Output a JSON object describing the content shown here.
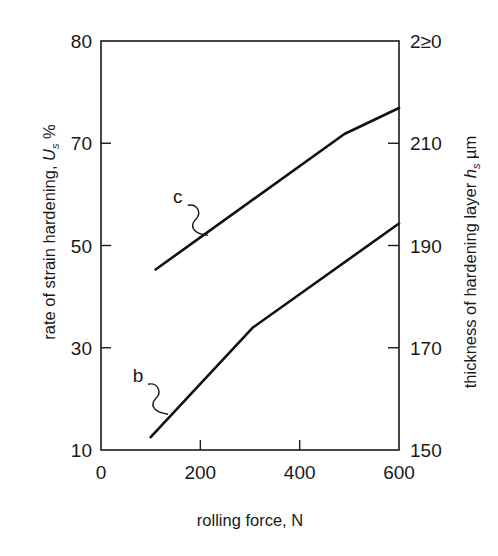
{
  "chart_data": {
    "type": "line",
    "title": "",
    "xlabel": "rolling force, N",
    "ylabel": {
      "text": "rate of strain hardening, ",
      "symbol": "U",
      "subscript": "s",
      "unit": " %"
    },
    "ylabel_right": {
      "text": "thickness of hardening layer ",
      "symbol": "h",
      "subscript": "s",
      "unit": " µm"
    },
    "xlim": [
      0,
      600
    ],
    "ylim": [
      10,
      90
    ],
    "ylim_right": [
      150,
      230
    ],
    "x_ticks": [
      {
        "value": 0,
        "label": "0"
      },
      {
        "value": 200,
        "label": "200"
      },
      {
        "value": 400,
        "label": "400"
      },
      {
        "value": 600,
        "label": "600"
      }
    ],
    "y_ticks": [
      {
        "value": 10,
        "label": "10"
      },
      {
        "value": 30,
        "label": "30"
      },
      {
        "value": 50,
        "label": "50"
      },
      {
        "value": 70,
        "label": "70"
      },
      {
        "value": 90,
        "label": "80"
      }
    ],
    "y_ticks_right": [
      {
        "value": 150,
        "label": "150"
      },
      {
        "value": 170,
        "label": "170"
      },
      {
        "value": 190,
        "label": "190"
      },
      {
        "value": 210,
        "label": "210"
      },
      {
        "value": 230,
        "label": "2≥0"
      }
    ],
    "grid": false,
    "legend": "none",
    "series": [
      {
        "name": "c",
        "axis": "left",
        "x": [
          110,
          490,
          600
        ],
        "y": [
          45.3,
          71.8,
          76.9
        ]
      },
      {
        "name": "b",
        "axis": "left",
        "x": [
          100,
          305,
          600
        ],
        "y": [
          12.5,
          33.9,
          54.3
        ]
      }
    ],
    "annotations": [
      {
        "text": "c",
        "series": "c",
        "anchor_x": 215,
        "anchor_y": 52
      },
      {
        "text": "b",
        "series": "b",
        "anchor_x": 135,
        "anchor_y": 17
      }
    ]
  }
}
